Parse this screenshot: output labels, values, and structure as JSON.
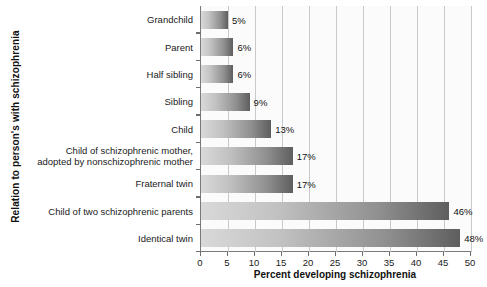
{
  "chart_data": {
    "type": "bar",
    "orientation": "horizontal",
    "title": "",
    "xlabel": "Percent developing schizophrenia",
    "ylabel": "Relation to person's with schizophrenia",
    "xlim": [
      0,
      50
    ],
    "xticks": [
      "0",
      "5",
      "10",
      "15",
      "20",
      "25",
      "30",
      "35",
      "40",
      "45",
      "50"
    ],
    "grid": "vertical",
    "legend": "none",
    "categories": [
      "Grandchild",
      "Parent",
      "Half sibling",
      "Sibling",
      "Child",
      "Child of schizophrenic mother,\nadopted by nonschizophrenic mother",
      "Fraternal twin",
      "Child of two schizophrenic parents",
      "Identical twin"
    ],
    "values": [
      5,
      6,
      6,
      9,
      13,
      17,
      17,
      46,
      48
    ],
    "value_labels": [
      "5%",
      "6%",
      "6%",
      "9%",
      "13%",
      "17%",
      "17%",
      "46%",
      "48%"
    ],
    "colors": {
      "bar_gradient_start": "#d9d9d9",
      "bar_gradient_end": "#5e5e5e",
      "plot_background": "#fbfbfb",
      "gridline": "#c9c9c9",
      "axis": "#7a7a7a",
      "text": "#1a1a1a"
    }
  }
}
